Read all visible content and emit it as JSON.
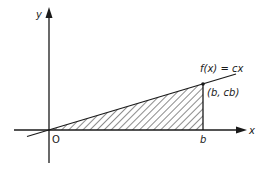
{
  "diagram": {
    "axes": {
      "x_label": "x",
      "y_label": "y",
      "origin_label": "O"
    },
    "function_label": "f(x) = cx",
    "point_label": "(b, cb)",
    "b_label": "b",
    "shaded_region": "triangle under the line from 0 to b",
    "colors": {
      "ink": "#1a1a1a",
      "background": "#ffffff"
    }
  }
}
